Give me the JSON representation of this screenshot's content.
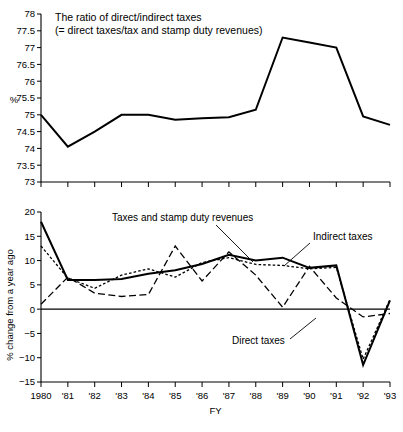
{
  "figure": {
    "x_axis_label": "FY",
    "categories": [
      "1980",
      "'81",
      "'82",
      "'83",
      "'84",
      "'85",
      "'86",
      "'87",
      "'88",
      "'89",
      "'90",
      "'91",
      "'92",
      "'93"
    ]
  },
  "chart_data": [
    {
      "type": "line",
      "panel": "top",
      "title": "The ratio of direct/indirect taxes",
      "subtitle": "(= direct taxes/tax and stamp duty revenues)",
      "xlabel": "",
      "ylabel": "%",
      "ylim": [
        73,
        78
      ],
      "ytick_step": 0.5,
      "grid": false,
      "legend": "none",
      "x": [
        "1980",
        "'81",
        "'82",
        "'83",
        "'84",
        "'85",
        "'86",
        "'87",
        "'88",
        "'89",
        "'90",
        "'91",
        "'92",
        "'93"
      ],
      "ytick_labels": [
        "78",
        "77.5",
        "77",
        "76.5",
        "76",
        "75.5",
        "75",
        "74.5",
        "74",
        "73.5",
        "73"
      ],
      "series": [
        {
          "name": "The ratio of direct/indirect taxes",
          "style": "solid",
          "values": [
            75.0,
            74.05,
            74.5,
            75.0,
            75.0,
            74.85,
            74.9,
            74.93,
            75.15,
            77.3,
            77.15,
            77.0,
            74.95,
            74.7
          ]
        }
      ]
    },
    {
      "type": "line",
      "panel": "bottom",
      "title": "",
      "xlabel": "FY",
      "ylabel": "% change from a year ago",
      "ylim": [
        -15,
        20
      ],
      "ytick_step": 5,
      "grid": false,
      "zero_line": true,
      "legend": "inline-annotations",
      "x": [
        "1980",
        "'81",
        "'82",
        "'83",
        "'84",
        "'85",
        "'86",
        "'87",
        "'88",
        "'89",
        "'90",
        "'91",
        "'92",
        "'93"
      ],
      "ytick_labels": [
        "20",
        "15",
        "10",
        "5",
        "0",
        "-5",
        "-10",
        "-15"
      ],
      "series": [
        {
          "name": "Taxes and stamp duty revenues",
          "style": "solid",
          "values": [
            18.0,
            6.0,
            6.0,
            6.2,
            7.3,
            8.0,
            9.3,
            11.2,
            10.0,
            10.6,
            8.5,
            9.0,
            -11.5,
            1.8
          ]
        },
        {
          "name": "Indirect taxes",
          "style": "dotted",
          "values": [
            13.0,
            6.4,
            4.3,
            7.0,
            8.3,
            6.6,
            9.6,
            10.6,
            9.2,
            9.0,
            8.3,
            8.6,
            -10.3,
            2.0
          ]
        },
        {
          "name": "Direct taxes",
          "style": "dashed",
          "values": [
            1.0,
            6.6,
            3.3,
            2.6,
            3.0,
            13.0,
            5.8,
            11.8,
            7.0,
            0.4,
            8.8,
            2.3,
            -1.6,
            -0.9
          ]
        }
      ],
      "annotations": [
        {
          "name": "Taxes and stamp duty revenues",
          "text": "Taxes and stamp duty revenues"
        },
        {
          "name": "Indirect taxes",
          "text": "Indirect taxes"
        },
        {
          "name": "Direct taxes",
          "text": "Direct taxes"
        }
      ]
    }
  ]
}
